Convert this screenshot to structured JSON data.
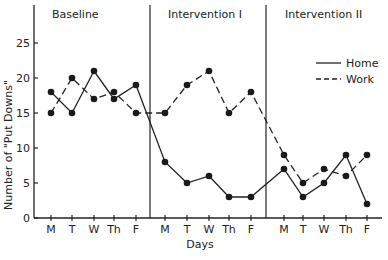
{
  "chart_data": {
    "type": "line",
    "title": "",
    "xlabel": "Days",
    "ylabel": "Number of \"Put Downs\"",
    "ylim": [
      0,
      30
    ],
    "yticks": [
      0,
      5,
      10,
      15,
      20,
      25
    ],
    "phases": [
      {
        "name": "Baseline",
        "days": [
          "M",
          "T",
          "W",
          "Th",
          "F"
        ]
      },
      {
        "name": "Intervention I",
        "days": [
          "M",
          "T",
          "W",
          "Th",
          "F"
        ]
      },
      {
        "name": "Intervention II",
        "days": [
          "M",
          "T",
          "W",
          "Th",
          "F"
        ]
      }
    ],
    "categories": [
      "M",
      "T",
      "W",
      "Th",
      "F",
      "M",
      "T",
      "W",
      "Th",
      "F",
      "M",
      "T",
      "W",
      "Th",
      "F"
    ],
    "series": [
      {
        "name": "Home",
        "style": "solid",
        "values": [
          18,
          15,
          21,
          17,
          19,
          8,
          5,
          6,
          3,
          3,
          7,
          3,
          5,
          9,
          2
        ]
      },
      {
        "name": "Work",
        "style": "dashed",
        "values": [
          15,
          20,
          17,
          18,
          15,
          15,
          19,
          21,
          15,
          18,
          9,
          5,
          7,
          6,
          9
        ]
      }
    ],
    "legend": {
      "position": "upper right (Intervention II panel)",
      "entries": [
        "Home",
        "Work"
      ]
    },
    "grid": false
  }
}
